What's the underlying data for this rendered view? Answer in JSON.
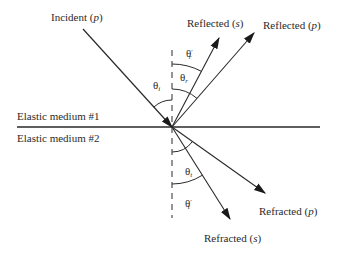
{
  "diagram": {
    "interface": {
      "upper_medium_label": "Elastic medium #1",
      "lower_medium_label": "Elastic medium #2"
    },
    "rays": [
      {
        "id": "incident_p",
        "label": "Incident",
        "mode": "p"
      },
      {
        "id": "reflected_s",
        "label": "Reflected",
        "mode": "s"
      },
      {
        "id": "reflected_p",
        "label": "Reflected",
        "mode": "p"
      },
      {
        "id": "refracted_p",
        "label": "Refracted",
        "mode": "p"
      },
      {
        "id": "refracted_s",
        "label": "Refracted",
        "mode": "s"
      }
    ],
    "angles": {
      "theta_i": {
        "symbol": "θ",
        "sub": "i",
        "prime": ""
      },
      "theta_r_prime": {
        "symbol": "θ",
        "sub": "r",
        "prime": "′"
      },
      "theta_r": {
        "symbol": "θ",
        "sub": "r",
        "prime": ""
      },
      "theta_t": {
        "symbol": "θ",
        "sub": "t",
        "prime": ""
      },
      "theta_t_prime": {
        "symbol": "θ",
        "sub": "t",
        "prime": "′"
      }
    },
    "colors": {
      "line": "#2a2a2a",
      "background": "#ffffff"
    }
  }
}
